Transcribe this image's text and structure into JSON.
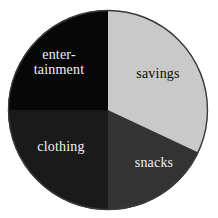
{
  "chart_data": {
    "type": "pie",
    "title": "",
    "subtitle": "",
    "xlabel": "",
    "ylabel": "",
    "grid": false,
    "legend": "none",
    "labels_placement": "inside-slices",
    "start_angle_deg": 0,
    "direction": "clockwise",
    "center_px": [
      108,
      110
    ],
    "radius_px": 100,
    "categories": [
      "savings",
      "snacks",
      "clothing",
      "entertainment"
    ],
    "values": [
      32,
      18,
      25,
      25
    ],
    "value_unit": "percent",
    "slices": [
      {
        "label": "savings",
        "value": 32,
        "start_angle_deg": 0,
        "end_angle_deg": 115.2,
        "color": "#c9c9c9",
        "label_color": "#0b0b0b",
        "label_lines": [
          "savings"
        ]
      },
      {
        "label": "snacks",
        "value": 18,
        "start_angle_deg": 115.2,
        "end_angle_deg": 180,
        "color": "#333333",
        "label_color": "#eeeeee",
        "label_lines": [
          "snacks"
        ]
      },
      {
        "label": "clothing",
        "value": 25,
        "start_angle_deg": 180,
        "end_angle_deg": 270,
        "color": "#1a1a1a",
        "label_color": "#f2f2f2",
        "label_lines": [
          "clothing"
        ]
      },
      {
        "label": "entertainment",
        "value": 25,
        "start_angle_deg": 270,
        "end_angle_deg": 360,
        "color": "#070707",
        "label_color": "#f2f2f2",
        "label_lines": [
          "enter-",
          "tainment"
        ]
      }
    ]
  },
  "figure": {
    "background_color": "#ffffff",
    "outline_color": "#3a3a3a"
  },
  "labels": {
    "entertainment": "enter-\ntainment",
    "savings": "savings",
    "clothing": "clothing",
    "snacks": "snacks"
  }
}
